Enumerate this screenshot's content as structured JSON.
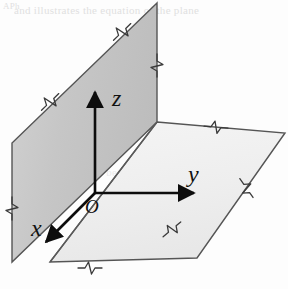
{
  "figure": {
    "background_color": "#fdfdfd",
    "width": 288,
    "height": 289
  },
  "planes": {
    "vertical": {
      "name": "xz-plane",
      "fill_color": "#c6c6c6",
      "fill_color_light": "#d6d6d6",
      "stroke_color": "#555555",
      "points": "157,3 12,143 12,262 157,122"
    },
    "horizontal": {
      "name": "xy-plane",
      "fill_color": "#f1f1f1",
      "fill_color_light": "#fafafa",
      "stroke_color": "#555555",
      "points": "157,122 285,133 197,258 50,262"
    }
  },
  "axes": [
    {
      "id": "z",
      "label": "z",
      "label_x": 116,
      "label_y": 104,
      "from_x": 95,
      "from_y": 193,
      "to_x": 95,
      "to_y": 92,
      "direction": "up",
      "color": "#0d0d0d"
    },
    {
      "id": "y",
      "label": "y",
      "label_x": 196,
      "label_y": 180,
      "from_x": 95,
      "from_y": 193,
      "to_x": 196,
      "to_y": 193,
      "direction": "right",
      "color": "#0d0d0d"
    },
    {
      "id": "x",
      "label": "x",
      "label_x": 37,
      "label_y": 233,
      "from_x": 95,
      "from_y": 193,
      "to_x": 44,
      "to_y": 244,
      "direction": "down-left",
      "color": "#0d0d0d"
    }
  ],
  "origin": {
    "label": "O",
    "x": 95,
    "y": 193,
    "label_x": 94,
    "label_y": 211,
    "color": "#0d0d0d"
  },
  "break_marks": [
    {
      "id": "vertical-plane-top-edge",
      "cx": 120,
      "cy": 34,
      "angle": -44
    },
    {
      "id": "vertical-plane-upper-left-edge",
      "cx": 48,
      "cy": 104,
      "angle": -44
    },
    {
      "id": "vertical-plane-right-edge",
      "cx": 157,
      "cy": 63,
      "angle": 90
    },
    {
      "id": "vertical-plane-left-edge",
      "cx": 12,
      "cy": 206,
      "angle": 90
    },
    {
      "id": "vertical-plane-bottom-edge",
      "cx": 88,
      "cy": 268,
      "angle": 0
    },
    {
      "id": "horizontal-plane-top-edge",
      "cx": 214,
      "cy": 127,
      "angle": 5
    },
    {
      "id": "horizontal-plane-right-edge",
      "cx": 245,
      "cy": 186,
      "angle": 55
    },
    {
      "id": "horizontal-plane-bottom-edge",
      "cx": 170,
      "cy": 231,
      "angle": -40
    }
  ],
  "scan_artifacts": {
    "top_line": "and illustrates the equation of the plane",
    "mid_line": "the distance between two points in space",
    "corner_mark": "APh"
  }
}
